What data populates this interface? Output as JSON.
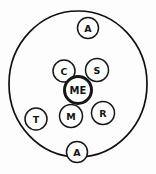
{
  "diagram": {
    "kind": "hand-drawn-ego-network",
    "background_color": "#fdfdfd",
    "ink_color": "#141414",
    "node_fill_color": "#ffffff",
    "boundary": {
      "name": "outer boundary circle",
      "center_x": 78,
      "center_y": 84,
      "radius_x": 69,
      "radius_y": 73,
      "stroke_width": 1.7
    },
    "ego": {
      "label": "ME",
      "cx": 78,
      "cy": 90,
      "r": 13.5,
      "stroke_width": 3.0,
      "font_size": 10
    },
    "alters": [
      {
        "label": "A",
        "cx": 88,
        "cy": 28,
        "r": 10.5,
        "stroke_width": 1.5,
        "font_size": 9.5,
        "position": "top, on boundary"
      },
      {
        "label": "S",
        "cx": 97,
        "cy": 70,
        "r": 11.5,
        "stroke_width": 1.5,
        "font_size": 9.5,
        "position": "upper right of ego"
      },
      {
        "label": "C",
        "cx": 64,
        "cy": 71,
        "r": 11,
        "stroke_width": 1.5,
        "font_size": 9.5,
        "position": "upper left of ego"
      },
      {
        "label": "R",
        "cx": 103,
        "cy": 113,
        "r": 11.5,
        "stroke_width": 1.5,
        "font_size": 9.5,
        "position": "lower right of ego"
      },
      {
        "label": "M",
        "cx": 71,
        "cy": 116,
        "r": 11.5,
        "stroke_width": 1.5,
        "font_size": 9.5,
        "position": "below ego"
      },
      {
        "label": "T",
        "cx": 36,
        "cy": 119,
        "r": 11,
        "stroke_width": 1.5,
        "font_size": 9.5,
        "position": "lower left, inside boundary"
      },
      {
        "label": "A",
        "cx": 77,
        "cy": 152,
        "r": 10.5,
        "stroke_width": 1.5,
        "font_size": 9.5,
        "position": "bottom, on boundary"
      }
    ]
  }
}
